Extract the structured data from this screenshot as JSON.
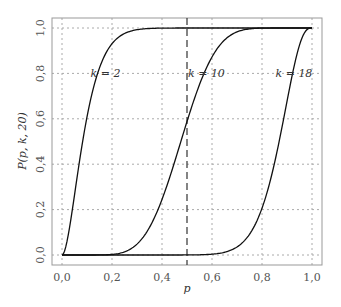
{
  "chart_data": {
    "type": "line",
    "title": "",
    "xlabel": "p",
    "ylabel": "P(p, k, 20)",
    "xlim": [
      0,
      1
    ],
    "ylim": [
      0,
      1
    ],
    "grid": true,
    "x_ticks": [
      "0,0",
      "0,2",
      "0,4",
      "0,6",
      "0,8",
      "1,0"
    ],
    "y_ticks": [
      "0,0",
      "0,2",
      "0,4",
      "0,6",
      "0,8",
      "1,0"
    ],
    "vline": {
      "x": 0.5,
      "style": "dashed"
    },
    "x": [
      0,
      0.05,
      0.1,
      0.15,
      0.2,
      0.25,
      0.3,
      0.35,
      0.4,
      0.45,
      0.5,
      0.55,
      0.6,
      0.65,
      0.7,
      0.75,
      0.8,
      0.85,
      0.9,
      0.95,
      1.0
    ],
    "series": [
      {
        "name": "k = 2",
        "values": [
          0,
          0.264,
          0.608,
          0.824,
          0.931,
          0.976,
          0.992,
          0.998,
          0.999,
          1,
          1,
          1,
          1,
          1,
          1,
          1,
          1,
          1,
          1,
          1,
          1
        ]
      },
      {
        "name": "k = 10",
        "values": [
          0,
          0,
          0,
          0.0002,
          0.0026,
          0.014,
          0.048,
          0.122,
          0.245,
          0.409,
          0.588,
          0.751,
          0.872,
          0.948,
          0.983,
          0.996,
          0.999,
          1,
          1,
          1,
          1
        ]
      },
      {
        "name": "k = 18",
        "values": [
          0,
          0,
          0,
          0,
          0,
          0,
          0,
          0,
          0,
          0,
          0.0002,
          0.0009,
          0.0036,
          0.0121,
          0.0355,
          0.091,
          0.206,
          0.405,
          0.677,
          0.925,
          1
        ]
      }
    ],
    "annotations": [
      {
        "text": "k = 2",
        "x": 0.13,
        "y": 0.8
      },
      {
        "text": "k = 10",
        "x": 0.52,
        "y": 0.8
      },
      {
        "text": "k = 18",
        "x": 0.87,
        "y": 0.8
      }
    ]
  }
}
